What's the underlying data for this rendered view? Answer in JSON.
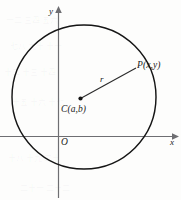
{
  "figure": {
    "type": "geometry-diagram",
    "background_color": "#fdfdfc",
    "ink_color": "#1a1a1a",
    "axis_color": "#6e6e72",
    "labels": {
      "point_p": "P(x,y)",
      "center_c": "C(a,b)",
      "radius": "r",
      "origin": "O",
      "axis_x": "x",
      "axis_y": "y"
    },
    "geometry": {
      "circle": {
        "cx": 84,
        "cy": 97,
        "r": 72
      },
      "center_point": {
        "x": 80,
        "y": 99
      },
      "point_p": {
        "x": 136,
        "y": 68
      },
      "origin": {
        "x": 58,
        "y": 136
      },
      "x_axis": {
        "x1": 0,
        "y1": 136,
        "x2": 176,
        "y2": 136
      },
      "y_axis": {
        "x1": 58,
        "y1": 196,
        "x2": 58,
        "y2": 11
      }
    }
  },
  "bleed_through": {
    "note": "faint mirrored text showing through from the reverse of the printed page",
    "marks": [
      "一二 三四 五六",
      "七八 九十 十一",
      "十二 十三 十四",
      "十五 十六 十七",
      "十八 十九 二十",
      "二十一 二十二"
    ]
  }
}
